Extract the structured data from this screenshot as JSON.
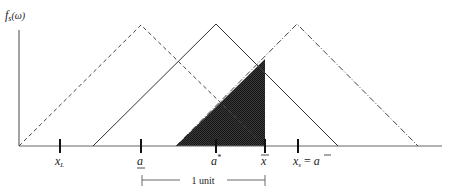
{
  "diagram": {
    "y_axis_label": "f",
    "y_axis_label_sub": "s",
    "y_axis_label_arg": "(ω)",
    "tick_labels": {
      "x_L": {
        "main": "x",
        "sub": "L"
      },
      "a_lower": {
        "main": "a"
      },
      "a_star": {
        "main": "a",
        "sup": "*"
      },
      "x_bar": {
        "main": "x"
      },
      "x_s": {
        "main": "x",
        "sub": "s",
        "rest": " = ",
        "rhs": "a"
      }
    },
    "bracket_label": "1 unit",
    "curves": [
      {
        "name": "left-density",
        "style": "dashed",
        "start": 19,
        "peak": 141,
        "end": 265
      },
      {
        "name": "middle-density",
        "style": "solid",
        "start": 93,
        "peak": 216,
        "end": 338
      },
      {
        "name": "right-density",
        "style": "dash-dot",
        "start": 176,
        "peak": 297,
        "end": 418
      }
    ],
    "shaded_region": {
      "color": "#333333",
      "pattern": "crosshatch"
    },
    "colors": {
      "line": "#333333",
      "axis": "#555555",
      "shade": "#2e2e2e"
    }
  }
}
